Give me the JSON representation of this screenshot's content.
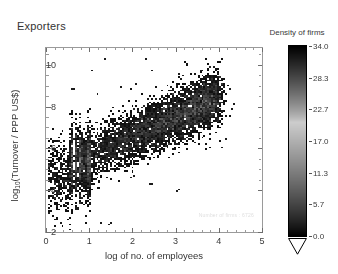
{
  "figure": {
    "title": "Exporters",
    "background_color": "#ffffff"
  },
  "chart_data": {
    "type": "heatmap",
    "title": "Exporters",
    "xlabel": "log of no. of employees",
    "ylabel": "log10(Turnover / PPP US$)",
    "ylabel_base": "log",
    "ylabel_sub": "10",
    "ylabel_rest": "(Turnover / PPP US$)",
    "xlim": [
      0,
      5
    ],
    "ylim": [
      2,
      10.8
    ],
    "xticks": [
      "0",
      "1",
      "2",
      "3",
      "4",
      "5"
    ],
    "xtick_values": [
      0,
      1,
      2,
      3,
      4,
      5
    ],
    "yticks": [
      "2",
      "4",
      "6",
      "8",
      "10"
    ],
    "ytick_values": [
      2,
      4,
      6,
      8,
      10
    ],
    "grid": false,
    "annotation": "Number of firms :  6726",
    "colorbar": {
      "title": "Density of firms",
      "ticks": [
        "34.0",
        "28.3",
        "22.7",
        "17.0",
        "11.3",
        "5.7",
        "0.0"
      ],
      "tick_values": [
        34.0,
        28.3,
        22.7,
        17.0,
        11.3,
        5.7,
        0.0
      ],
      "vmin": 0.0,
      "vmax": 34.0,
      "colormap": "grayscale-inverted-band",
      "extend": "min"
    },
    "density": {
      "description": "2D density of exporting firms over log-employees (x) vs log10-turnover (y). Point cloud is elongated along a positive linear trend with slope ~1 in log-log space.",
      "cell_size_x": 0.045,
      "cell_size_y": 0.08,
      "ridge_slope": 0.95,
      "ridge_intercept": 4.65,
      "ridge_scatter_sigma": 0.62,
      "peak_density": 34,
      "peak_x": 1.55,
      "peak_y": 6.15,
      "n_points": 6726,
      "stripe_x_positions": [
        0.6,
        0.7,
        0.78,
        0.85,
        0.95,
        1.0
      ],
      "x_min_data": 0.0,
      "x_max_data": 4.35,
      "y_min_data": 2.4,
      "y_max_data": 10.35
    }
  }
}
